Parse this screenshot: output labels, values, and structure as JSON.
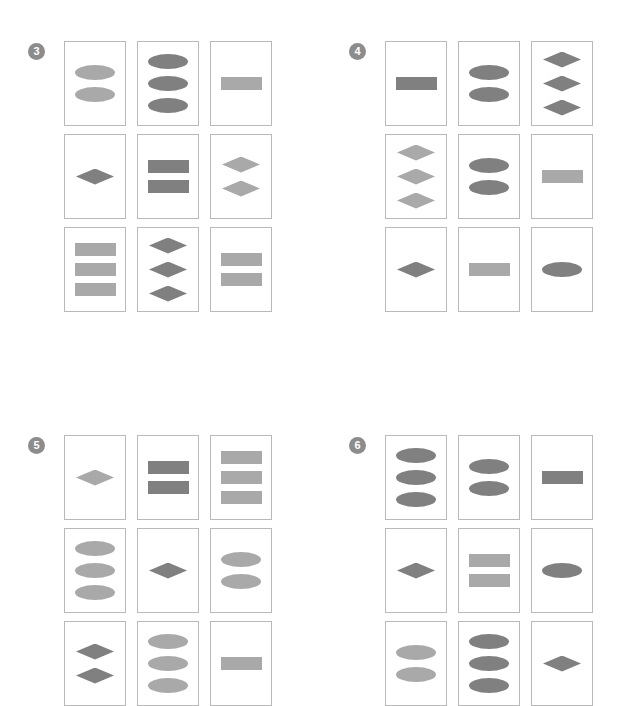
{
  "page": {
    "background_color": "#ffffff",
    "card_border_color": "#b9b9b9",
    "badge_color": "#8c8c8c",
    "badge_text_color": "#ffffff",
    "tones": {
      "light": "#a9a9a9",
      "dark": "#808080"
    },
    "shape_types": [
      "ellipse",
      "rect",
      "diamond"
    ]
  },
  "panels": [
    {
      "number": "3",
      "badge_label": "3",
      "cells": [
        {
          "position": "row1-col1",
          "shapes": [
            {
              "type": "ellipse",
              "tone": "light"
            },
            {
              "type": "ellipse",
              "tone": "light"
            }
          ]
        },
        {
          "position": "row1-col2",
          "shapes": [
            {
              "type": "ellipse",
              "tone": "dark"
            },
            {
              "type": "ellipse",
              "tone": "dark"
            },
            {
              "type": "ellipse",
              "tone": "dark"
            }
          ]
        },
        {
          "position": "row1-col3",
          "shapes": [
            {
              "type": "rect",
              "tone": "light"
            }
          ]
        },
        {
          "position": "row2-col1",
          "shapes": [
            {
              "type": "diamond",
              "tone": "dark"
            }
          ]
        },
        {
          "position": "row2-col2",
          "shapes": [
            {
              "type": "rect",
              "tone": "dark"
            },
            {
              "type": "rect",
              "tone": "dark"
            }
          ]
        },
        {
          "position": "row2-col3",
          "shapes": [
            {
              "type": "diamond",
              "tone": "light"
            },
            {
              "type": "diamond",
              "tone": "light"
            }
          ]
        },
        {
          "position": "row3-col1",
          "shapes": [
            {
              "type": "rect",
              "tone": "light"
            },
            {
              "type": "rect",
              "tone": "light"
            },
            {
              "type": "rect",
              "tone": "light"
            }
          ]
        },
        {
          "position": "row3-col2",
          "shapes": [
            {
              "type": "diamond",
              "tone": "dark"
            },
            {
              "type": "diamond",
              "tone": "dark"
            },
            {
              "type": "diamond",
              "tone": "dark"
            }
          ]
        },
        {
          "position": "row3-col3",
          "shapes": [
            {
              "type": "rect",
              "tone": "light"
            },
            {
              "type": "rect",
              "tone": "light"
            }
          ]
        }
      ]
    },
    {
      "number": "4",
      "badge_label": "4",
      "cells": [
        {
          "position": "row1-col1",
          "shapes": [
            {
              "type": "rect",
              "tone": "dark"
            }
          ]
        },
        {
          "position": "row1-col2",
          "shapes": [
            {
              "type": "ellipse",
              "tone": "dark"
            },
            {
              "type": "ellipse",
              "tone": "dark"
            }
          ]
        },
        {
          "position": "row1-col3",
          "shapes": [
            {
              "type": "diamond",
              "tone": "dark"
            },
            {
              "type": "diamond",
              "tone": "dark"
            },
            {
              "type": "diamond",
              "tone": "dark"
            }
          ]
        },
        {
          "position": "row2-col1",
          "shapes": [
            {
              "type": "diamond",
              "tone": "light"
            },
            {
              "type": "diamond",
              "tone": "light"
            },
            {
              "type": "diamond",
              "tone": "light"
            }
          ]
        },
        {
          "position": "row2-col2",
          "shapes": [
            {
              "type": "ellipse",
              "tone": "dark"
            },
            {
              "type": "ellipse",
              "tone": "dark"
            }
          ]
        },
        {
          "position": "row2-col3",
          "shapes": [
            {
              "type": "rect",
              "tone": "light"
            }
          ]
        },
        {
          "position": "row3-col1",
          "shapes": [
            {
              "type": "diamond",
              "tone": "dark"
            }
          ]
        },
        {
          "position": "row3-col2",
          "shapes": [
            {
              "type": "rect",
              "tone": "light"
            }
          ]
        },
        {
          "position": "row3-col3",
          "shapes": [
            {
              "type": "ellipse",
              "tone": "dark"
            }
          ]
        }
      ]
    },
    {
      "number": "5",
      "badge_label": "5",
      "cells": [
        {
          "position": "row1-col1",
          "shapes": [
            {
              "type": "diamond",
              "tone": "light"
            }
          ]
        },
        {
          "position": "row1-col2",
          "shapes": [
            {
              "type": "rect",
              "tone": "dark"
            },
            {
              "type": "rect",
              "tone": "dark"
            }
          ]
        },
        {
          "position": "row1-col3",
          "shapes": [
            {
              "type": "rect",
              "tone": "light"
            },
            {
              "type": "rect",
              "tone": "light"
            },
            {
              "type": "rect",
              "tone": "light"
            }
          ]
        },
        {
          "position": "row2-col1",
          "shapes": [
            {
              "type": "ellipse",
              "tone": "light"
            },
            {
              "type": "ellipse",
              "tone": "light"
            },
            {
              "type": "ellipse",
              "tone": "light"
            }
          ]
        },
        {
          "position": "row2-col2",
          "shapes": [
            {
              "type": "diamond",
              "tone": "dark"
            }
          ]
        },
        {
          "position": "row2-col3",
          "shapes": [
            {
              "type": "ellipse",
              "tone": "light"
            },
            {
              "type": "ellipse",
              "tone": "light"
            }
          ]
        },
        {
          "position": "row3-col1",
          "shapes": [
            {
              "type": "diamond",
              "tone": "dark"
            },
            {
              "type": "diamond",
              "tone": "dark"
            }
          ]
        },
        {
          "position": "row3-col2",
          "shapes": [
            {
              "type": "ellipse",
              "tone": "light"
            },
            {
              "type": "ellipse",
              "tone": "light"
            },
            {
              "type": "ellipse",
              "tone": "light"
            }
          ]
        },
        {
          "position": "row3-col3",
          "shapes": [
            {
              "type": "rect",
              "tone": "light"
            }
          ]
        }
      ]
    },
    {
      "number": "6",
      "badge_label": "6",
      "cells": [
        {
          "position": "row1-col1",
          "shapes": [
            {
              "type": "ellipse",
              "tone": "dark"
            },
            {
              "type": "ellipse",
              "tone": "dark"
            },
            {
              "type": "ellipse",
              "tone": "dark"
            }
          ]
        },
        {
          "position": "row1-col2",
          "shapes": [
            {
              "type": "ellipse",
              "tone": "dark"
            },
            {
              "type": "ellipse",
              "tone": "dark"
            }
          ]
        },
        {
          "position": "row1-col3",
          "shapes": [
            {
              "type": "rect",
              "tone": "dark"
            }
          ]
        },
        {
          "position": "row2-col1",
          "shapes": [
            {
              "type": "diamond",
              "tone": "dark"
            }
          ]
        },
        {
          "position": "row2-col2",
          "shapes": [
            {
              "type": "rect",
              "tone": "light"
            },
            {
              "type": "rect",
              "tone": "light"
            }
          ]
        },
        {
          "position": "row2-col3",
          "shapes": [
            {
              "type": "ellipse",
              "tone": "dark"
            }
          ]
        },
        {
          "position": "row3-col1",
          "shapes": [
            {
              "type": "ellipse",
              "tone": "light"
            },
            {
              "type": "ellipse",
              "tone": "light"
            }
          ]
        },
        {
          "position": "row3-col2",
          "shapes": [
            {
              "type": "ellipse",
              "tone": "dark"
            },
            {
              "type": "ellipse",
              "tone": "dark"
            },
            {
              "type": "ellipse",
              "tone": "dark"
            }
          ]
        },
        {
          "position": "row3-col3",
          "shapes": [
            {
              "type": "diamond",
              "tone": "dark"
            }
          ]
        }
      ]
    }
  ],
  "layout": {
    "panel_positions": [
      {
        "badge_left": 28,
        "badge_top": 43,
        "grid_left": 64,
        "grid_top": 41
      },
      {
        "badge_left": 349,
        "badge_top": 43,
        "grid_left": 385,
        "grid_top": 41
      },
      {
        "badge_left": 28,
        "badge_top": 437,
        "grid_left": 64,
        "grid_top": 435
      },
      {
        "badge_left": 349,
        "badge_top": 437,
        "grid_left": 385,
        "grid_top": 435
      }
    ]
  }
}
